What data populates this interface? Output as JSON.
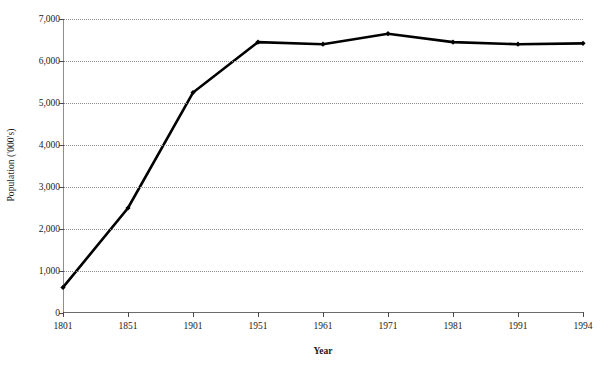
{
  "chart_data": {
    "type": "line",
    "title": "",
    "xlabel": "Year",
    "ylabel": "Population ('000's)",
    "categories": [
      "1801",
      "1851",
      "1901",
      "1951",
      "1961",
      "1971",
      "1981",
      "1991",
      "1994"
    ],
    "values": [
      610,
      2500,
      5250,
      6450,
      6400,
      6650,
      6450,
      6400,
      6420
    ],
    "ylim": [
      0,
      7000
    ],
    "ytick_labels": [
      "7,000",
      "6,000",
      "5,000",
      "4,000",
      "3,000",
      "2,000",
      "1,000",
      "0"
    ],
    "ytick_values": [
      7000,
      6000,
      5000,
      4000,
      3000,
      2000,
      1000,
      0
    ],
    "grid": true,
    "legend": "none",
    "series_color": "#000000",
    "gridline_color": "#8c8c8c",
    "marker": "filled-diamond",
    "x_positions_pct": [
      0,
      12.5,
      25.0,
      37.5,
      50.0,
      62.5,
      75.0,
      87.5,
      100.0
    ]
  }
}
